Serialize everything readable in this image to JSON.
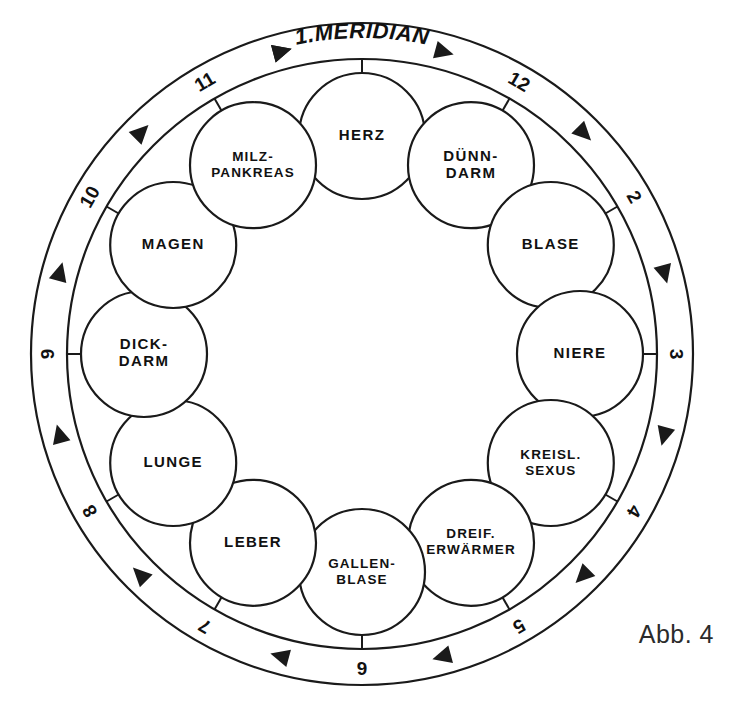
{
  "figure": {
    "caption": "Abb. 4",
    "title": "1.MERIDIAN"
  },
  "diagram": {
    "type": "meridian-clock-wheel",
    "center_x": 362,
    "center_y": 354,
    "outer_ring_radius": 331,
    "inner_ring_radius": 295,
    "organ_orbit_radius": 218,
    "organ_circle_radius": 63,
    "accent_color": "#1a1a1a",
    "background_color": "#ffffff",
    "flow_direction": "clockwise"
  },
  "ring_numbers": [
    {
      "value": "12",
      "angle": -60
    },
    {
      "value": "2",
      "angle": -30
    },
    {
      "value": "3",
      "angle": 0
    },
    {
      "value": "4",
      "angle": 30
    },
    {
      "value": "5",
      "angle": 60
    },
    {
      "value": "6",
      "angle": 90
    },
    {
      "value": "7",
      "angle": 120
    },
    {
      "value": "8",
      "angle": 150
    },
    {
      "value": "9",
      "angle": 180
    },
    {
      "value": "10",
      "angle": 210
    },
    {
      "value": "11",
      "angle": 240
    }
  ],
  "organs": [
    {
      "id": "herz",
      "lines": [
        "HERZ"
      ],
      "angle": -90,
      "size": "normal"
    },
    {
      "id": "duenndarm",
      "lines": [
        "DÜNN-",
        "DARM"
      ],
      "angle": -60,
      "size": "normal"
    },
    {
      "id": "blase",
      "lines": [
        "BLASE"
      ],
      "angle": -30,
      "size": "normal"
    },
    {
      "id": "niere",
      "lines": [
        "NIERE"
      ],
      "angle": 0,
      "size": "normal"
    },
    {
      "id": "kreisl-sexus",
      "lines": [
        "KREISL.",
        "SEXUS"
      ],
      "angle": 30,
      "size": "small"
    },
    {
      "id": "dreif-erwaermer",
      "lines": [
        "DREIF.",
        "ERWÄRMER"
      ],
      "angle": 60,
      "size": "small"
    },
    {
      "id": "gallenblase",
      "lines": [
        "GALLEN-",
        "BLASE"
      ],
      "angle": 90,
      "size": "small"
    },
    {
      "id": "leber",
      "lines": [
        "LEBER"
      ],
      "angle": 120,
      "size": "normal"
    },
    {
      "id": "lunge",
      "lines": [
        "LUNGE"
      ],
      "angle": 150,
      "size": "normal"
    },
    {
      "id": "dickdarm",
      "lines": [
        "DICK-",
        "DARM"
      ],
      "angle": 180,
      "size": "normal"
    },
    {
      "id": "magen",
      "lines": [
        "MAGEN"
      ],
      "angle": 210,
      "size": "normal"
    },
    {
      "id": "milz-pankreas",
      "lines": [
        "MILZ-",
        "PANKREAS"
      ],
      "angle": 240,
      "size": "small"
    }
  ],
  "arrows": [
    {
      "angle": -105
    },
    {
      "angle": -75
    },
    {
      "angle": -45
    },
    {
      "angle": -15
    },
    {
      "angle": 15
    },
    {
      "angle": 45
    },
    {
      "angle": 75
    },
    {
      "angle": 105
    },
    {
      "angle": 135
    },
    {
      "angle": 165
    },
    {
      "angle": 195
    },
    {
      "angle": 225
    },
    {
      "angle": 255
    }
  ]
}
